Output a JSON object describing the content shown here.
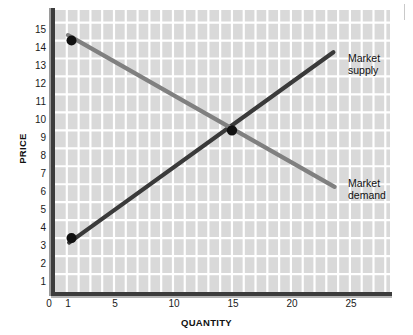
{
  "chart_data": {
    "type": "line",
    "title": "",
    "xlabel": "QUANTITY",
    "ylabel": "PRICE",
    "xlim": [
      0,
      28.4
    ],
    "ylim": [
      0,
      15.7
    ],
    "xticks": [
      0,
      1,
      5,
      10,
      15,
      20,
      25
    ],
    "xtick_labels": [
      "0",
      "1",
      "5",
      "10",
      "15",
      "20",
      "25"
    ],
    "yticks": [
      1,
      2,
      3,
      4,
      5,
      6,
      7,
      8,
      9,
      10,
      11,
      12,
      13,
      14,
      15
    ],
    "ytick_labels": [
      "1",
      "2",
      "3",
      "4",
      "5",
      "6",
      "7",
      "8",
      "9",
      "10",
      "11",
      "12",
      "13",
      "14",
      "15"
    ],
    "grid": true,
    "grid_color": "#ffffff",
    "plot_bg": "#d9d9d9",
    "legend_position": "inline-right",
    "series": [
      {
        "name": "Market supply",
        "label": "Market\nsupply",
        "color": "#3a3a3a",
        "points": [
          [
            1.2,
            2.75
          ],
          [
            23.6,
            13.35
          ]
        ],
        "markers": [
          [
            1.4,
            3
          ]
        ]
      },
      {
        "name": "Market demand",
        "label": "Market\ndemand",
        "color": "#808080",
        "points": [
          [
            1.1,
            14.3
          ],
          [
            23.7,
            5.85
          ]
        ],
        "markers": [
          [
            1.4,
            14
          ]
        ]
      }
    ],
    "equilibrium": {
      "x": 15,
      "y": 9,
      "label": ""
    },
    "annotations": []
  },
  "labels": {
    "supply": "Market\nsupply",
    "demand": "Market\ndemand",
    "x_axis_title": "QUANTITY",
    "y_axis_title": "PRICE"
  },
  "ytick_text": {
    "t1": "1",
    "t2": "2",
    "t3": "3",
    "t4": "4",
    "t5": "5",
    "t6": "6",
    "t7": "7",
    "t8": "8",
    "t9": "9",
    "t10": "10",
    "t11": "11",
    "t12": "12",
    "t13": "13",
    "t14": "14",
    "t15": "15"
  },
  "xtick_text": {
    "t0": "0",
    "t1": "1",
    "t5": "5",
    "t10": "10",
    "t15": "15",
    "t20": "20",
    "t25": "25"
  }
}
